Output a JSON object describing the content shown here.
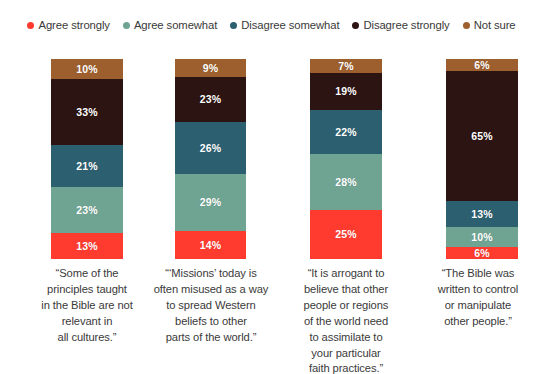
{
  "legend": {
    "items": [
      {
        "label": "Agree strongly",
        "color": "#FF3B2F",
        "icon": "legend-dot-icon"
      },
      {
        "label": "Agree somewhat",
        "color": "#6FA392",
        "icon": "legend-dot-icon"
      },
      {
        "label": "Disagree somewhat",
        "color": "#2C5F70",
        "icon": "legend-dot-icon"
      },
      {
        "label": "Disagree strongly",
        "color": "#2B1411",
        "icon": "legend-dot-icon"
      },
      {
        "label": "Not sure",
        "color": "#9C5F2D",
        "icon": "legend-dot-icon"
      }
    ]
  },
  "chart_data": {
    "type": "bar",
    "subtype": "stacked-column-100",
    "title": "",
    "subtitle": "",
    "xlabel": "",
    "ylabel": "",
    "ylim": [
      0,
      100
    ],
    "grid": false,
    "legend_position": "top",
    "value_suffix": "%",
    "stack_order_bottom_to_top": [
      "Agree strongly",
      "Agree somewhat",
      "Disagree somewhat",
      "Disagree strongly",
      "Not sure"
    ],
    "categories": [
      "“Some of the principles taught in the Bible are not relevant in all cultures.”",
      "“‘Missions’ today is often misused as a way to spread Western beliefs to other parts of the world.”",
      "“It is arrogant to believe that other people or regions of the world need to assimilate to your particular faith practices.”",
      "“The Bible was written to control or manipulate other people.”"
    ],
    "series": [
      {
        "name": "Agree strongly",
        "color": "#FF3B2F",
        "values": [
          13,
          14,
          25,
          6
        ]
      },
      {
        "name": "Agree somewhat",
        "color": "#6FA392",
        "values": [
          23,
          29,
          28,
          10
        ]
      },
      {
        "name": "Disagree somewhat",
        "color": "#2C5F70",
        "values": [
          21,
          26,
          22,
          13
        ]
      },
      {
        "name": "Disagree strongly",
        "color": "#2B1411",
        "values": [
          33,
          23,
          19,
          65
        ]
      },
      {
        "name": "Not sure",
        "color": "#9C5F2D",
        "values": [
          10,
          9,
          7,
          6
        ]
      }
    ],
    "bars": [
      {
        "caption_lines": [
          "“Some of the",
          "principles taught",
          "in the Bible are not",
          "relevant in",
          "all cultures.”"
        ],
        "segments": [
          {
            "name": "Not sure",
            "value": "10%",
            "pct": 10,
            "color": "#9C5F2D"
          },
          {
            "name": "Disagree strongly",
            "value": "33%",
            "pct": 33,
            "color": "#2B1411"
          },
          {
            "name": "Disagree somewhat",
            "value": "21%",
            "pct": 21,
            "color": "#2C5F70"
          },
          {
            "name": "Agree somewhat",
            "value": "23%",
            "pct": 23,
            "color": "#6FA392"
          },
          {
            "name": "Agree strongly",
            "value": "13%",
            "pct": 13,
            "color": "#FF3B2F"
          }
        ]
      },
      {
        "caption_lines": [
          "“‘Missions’ today is",
          "often misused as a way",
          "to spread Western",
          "beliefs to other",
          "parts of the world.”"
        ],
        "segments": [
          {
            "name": "Not sure",
            "value": "9%",
            "pct": 9,
            "color": "#9C5F2D"
          },
          {
            "name": "Disagree strongly",
            "value": "23%",
            "pct": 23,
            "color": "#2B1411"
          },
          {
            "name": "Disagree somewhat",
            "value": "26%",
            "pct": 26,
            "color": "#2C5F70"
          },
          {
            "name": "Agree somewhat",
            "value": "29%",
            "pct": 29,
            "color": "#6FA392"
          },
          {
            "name": "Agree strongly",
            "value": "14%",
            "pct": 14,
            "color": "#FF3B2F"
          }
        ]
      },
      {
        "caption_lines": [
          "“It is arrogant to",
          "believe that other",
          "people or regions",
          "of the world need",
          "to assimilate to",
          "your particular",
          "faith practices.”"
        ],
        "segments": [
          {
            "name": "Not sure",
            "value": "7%",
            "pct": 7,
            "color": "#9C5F2D"
          },
          {
            "name": "Disagree strongly",
            "value": "19%",
            "pct": 19,
            "color": "#2B1411"
          },
          {
            "name": "Disagree somewhat",
            "value": "22%",
            "pct": 22,
            "color": "#2C5F70"
          },
          {
            "name": "Agree somewhat",
            "value": "28%",
            "pct": 28,
            "color": "#6FA392"
          },
          {
            "name": "Agree strongly",
            "value": "25%",
            "pct": 25,
            "color": "#FF3B2F"
          }
        ]
      },
      {
        "caption_lines": [
          "“The Bible was",
          "written to control",
          "or manipulate",
          "other people.”"
        ],
        "segments": [
          {
            "name": "Not sure",
            "value": "6%",
            "pct": 6,
            "color": "#9C5F2D"
          },
          {
            "name": "Disagree strongly",
            "value": "65%",
            "pct": 65,
            "color": "#2B1411"
          },
          {
            "name": "Disagree somewhat",
            "value": "13%",
            "pct": 13,
            "color": "#2C5F70"
          },
          {
            "name": "Agree somewhat",
            "value": "10%",
            "pct": 10,
            "color": "#6FA392"
          },
          {
            "name": "Agree strongly",
            "value": "6%",
            "pct": 6,
            "color": "#FF3B2F"
          }
        ]
      }
    ]
  },
  "layout": {
    "bar_geometry": [
      {
        "left": 51,
        "width": 72,
        "caption_left": 24,
        "caption_width": 126
      },
      {
        "left": 175,
        "width": 71,
        "caption_left": 148,
        "caption_width": 126
      },
      {
        "left": 310,
        "width": 72,
        "caption_left": 283,
        "caption_width": 126
      },
      {
        "left": 446,
        "width": 72,
        "caption_left": 414,
        "caption_width": 128
      }
    ]
  }
}
